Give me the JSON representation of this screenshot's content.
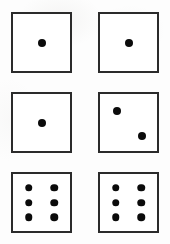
{
  "scene": {
    "title": "Six dice faces",
    "background_color": "#fdfdfd",
    "die_face_color": "#ffffff",
    "die_border_color": "#2b2b2b",
    "pip_color": "#0b0b0b",
    "grid_columns": 2,
    "grid_rows": 3,
    "die_count": 6
  },
  "dice": [
    {
      "name": "die-top-left",
      "value": "1",
      "value_label": "one",
      "x": 11,
      "y": 12,
      "size": 61,
      "pip_diameter": 8,
      "pips": [
        {
          "cx": 50,
          "cy": 50
        }
      ]
    },
    {
      "name": "die-top-right",
      "value": "1",
      "value_label": "one",
      "x": 98,
      "y": 12,
      "size": 61,
      "pip_diameter": 8,
      "pips": [
        {
          "cx": 50,
          "cy": 50
        }
      ]
    },
    {
      "name": "die-middle-left",
      "value": "1",
      "value_label": "one",
      "x": 11,
      "y": 92,
      "size": 61,
      "pip_diameter": 8,
      "pips": [
        {
          "cx": 50,
          "cy": 50
        }
      ]
    },
    {
      "name": "die-middle-right",
      "value": "2",
      "value_label": "two",
      "x": 98,
      "y": 92,
      "size": 61,
      "pip_diameter": 8,
      "pips": [
        {
          "cx": 29,
          "cy": 29
        },
        {
          "cx": 73,
          "cy": 73
        }
      ]
    },
    {
      "name": "die-bottom-left",
      "value": "6",
      "value_label": "six",
      "x": 11,
      "y": 172,
      "size": 61,
      "pip_diameter": 7.5,
      "pips": [
        {
          "cx": 28,
          "cy": 24
        },
        {
          "cx": 72,
          "cy": 24
        },
        {
          "cx": 28,
          "cy": 50
        },
        {
          "cx": 72,
          "cy": 50
        },
        {
          "cx": 28,
          "cy": 76
        },
        {
          "cx": 72,
          "cy": 76
        }
      ]
    },
    {
      "name": "die-bottom-right",
      "value": "6",
      "value_label": "six",
      "x": 98,
      "y": 172,
      "size": 61,
      "pip_diameter": 7.5,
      "pips": [
        {
          "cx": 28,
          "cy": 24
        },
        {
          "cx": 72,
          "cy": 24
        },
        {
          "cx": 28,
          "cy": 50
        },
        {
          "cx": 72,
          "cy": 50
        },
        {
          "cx": 28,
          "cy": 76
        },
        {
          "cx": 72,
          "cy": 76
        }
      ]
    }
  ]
}
